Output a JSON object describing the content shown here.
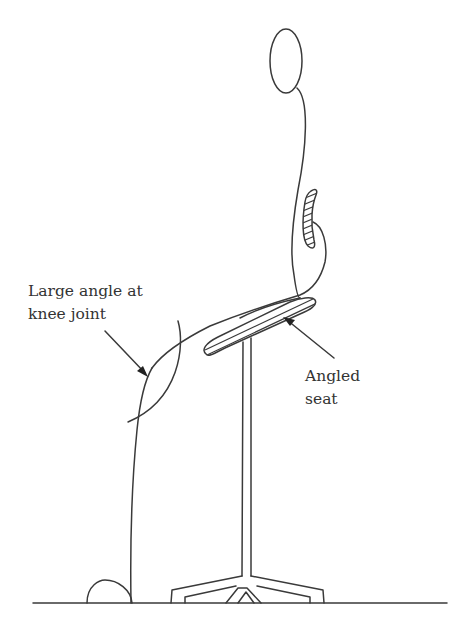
{
  "figure": {
    "annotations": {
      "knee": {
        "line1": "Large angle at",
        "line2": "knee joint"
      },
      "seat": {
        "line1": "Angled",
        "line2": "seat"
      }
    },
    "colors": {
      "line": "#3a3a3a",
      "text": "#333333",
      "background": "#ffffff"
    }
  }
}
